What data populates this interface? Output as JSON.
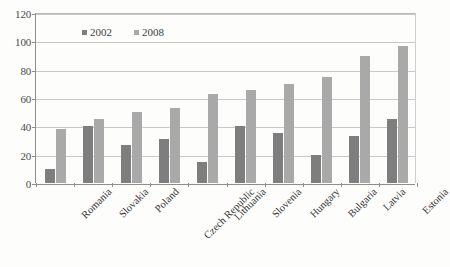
{
  "chart_data": {
    "type": "bar",
    "title": "",
    "xlabel": "",
    "ylabel": "",
    "ylim": [
      0,
      120
    ],
    "yticks": [
      0,
      20,
      40,
      60,
      80,
      100,
      120
    ],
    "grid": true,
    "legend_position": "top-center-inside",
    "categories": [
      "Romania",
      "Slovakia",
      "Poland",
      "Czech Republic",
      "Lithuania",
      "Slovenia",
      "Hungary",
      "Bulgaria",
      "Latvia",
      "Estonia"
    ],
    "series": [
      {
        "name": "2002",
        "color": "#7e7e7e",
        "values": [
          10,
          40,
          27,
          31,
          15,
          40,
          35,
          20,
          33,
          45
        ]
      },
      {
        "name": "2008",
        "color": "#a9a9a9",
        "values": [
          38,
          45,
          50,
          53,
          63,
          66,
          70,
          75,
          90,
          97
        ]
      }
    ]
  },
  "axis": {
    "y_tick_labels": [
      "120",
      "100",
      "80",
      "60",
      "40",
      "20",
      "0"
    ]
  },
  "legend": {
    "items": [
      {
        "label": "2002",
        "color": "#7e7e7e"
      },
      {
        "label": "2008",
        "color": "#a9a9a9"
      }
    ]
  }
}
